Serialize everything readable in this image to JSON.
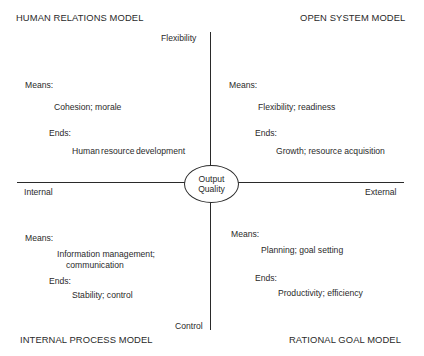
{
  "diagram": {
    "type": "competing-values-framework",
    "center": {
      "line1": "Output",
      "line2": "Quality"
    },
    "axes": {
      "vertical": {
        "top": "Flexibility",
        "bottom": "Control"
      },
      "horizontal": {
        "left": "Internal",
        "right": "External"
      }
    },
    "quadrants": {
      "top_left": {
        "title": "HUMAN RELATIONS MODEL",
        "means_label": "Means:",
        "means": "Cohesion; morale",
        "ends_label": "Ends:",
        "ends": "Human resource development"
      },
      "top_right": {
        "title": "OPEN SYSTEM MODEL",
        "means_label": "Means:",
        "means": "Flexibility; readiness",
        "ends_label": "Ends:",
        "ends": "Growth; resource acquisition"
      },
      "bottom_left": {
        "title": "INTERNAL PROCESS MODEL",
        "means_label": "Means:",
        "means_line1": "Information management;",
        "means_line2": "communication",
        "ends_label": "Ends:",
        "ends": "Stability; control"
      },
      "bottom_right": {
        "title": "RATIONAL GOAL MODEL",
        "means_label": "Means:",
        "means": "Planning; goal setting",
        "ends_label": "Ends:",
        "ends": "Productivity; efficiency"
      }
    }
  }
}
